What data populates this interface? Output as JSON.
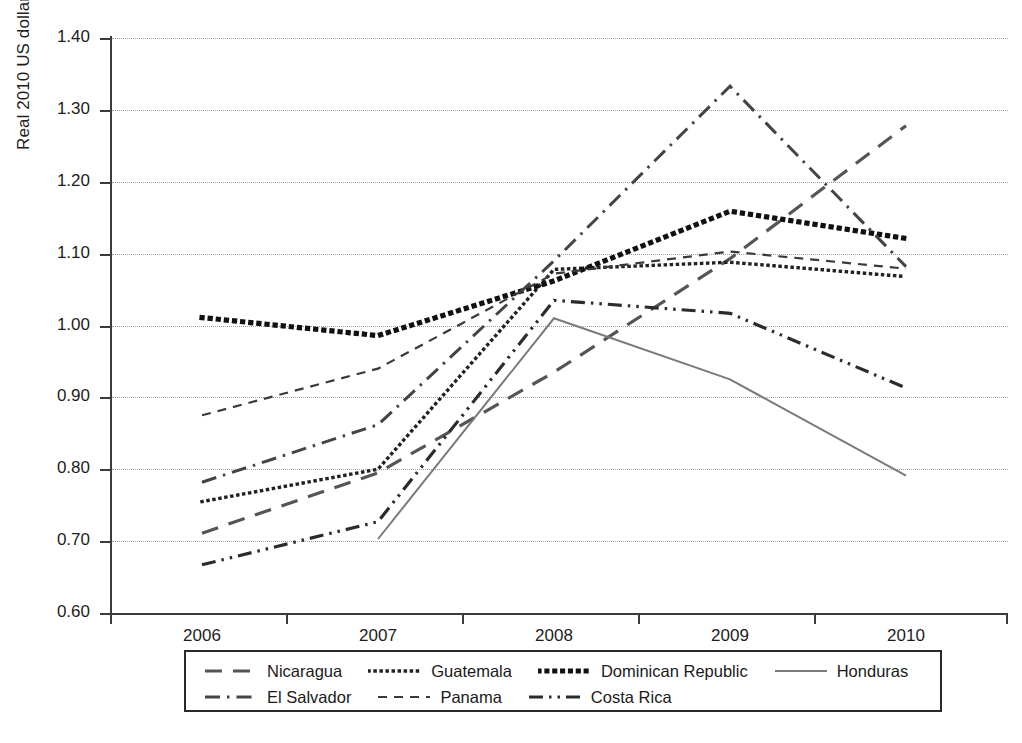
{
  "chart_data": {
    "type": "line",
    "title": "",
    "xlabel": "",
    "ylabel": "Real 2010 US dollars per kilo",
    "x": [
      "2006",
      "2007",
      "2008",
      "2009",
      "2010"
    ],
    "xlim": [
      2005.5,
      2010.5
    ],
    "ylim": [
      0.6,
      1.4
    ],
    "yticks": [
      "0.60",
      "0.70",
      "0.80",
      "0.90",
      "1.00",
      "1.10",
      "1.20",
      "1.30",
      "1.40"
    ],
    "grid": true,
    "legend_position": "bottom",
    "series": [
      {
        "name": "Nicaragua",
        "dash": "long-dash",
        "color": "#555555",
        "width": 3.2,
        "values": [
          0.711,
          0.795,
          0.935,
          1.093,
          1.278
        ]
      },
      {
        "name": "Guatemala",
        "dash": "dotted",
        "color": "#222222",
        "width": 3.4,
        "values": [
          0.755,
          0.8,
          1.078,
          1.088,
          1.068
        ]
      },
      {
        "name": "Dominican Republic",
        "dash": "thick-dotted",
        "color": "#111111",
        "width": 5.2,
        "values": [
          1.011,
          0.986,
          1.062,
          1.159,
          1.121
        ]
      },
      {
        "name": "Honduras",
        "dash": "solid",
        "color": "#7a7a7a",
        "width": 2.0,
        "values": [
          null,
          0.703,
          1.01,
          0.925,
          0.791
        ]
      },
      {
        "name": "El Salvador",
        "dash": "dash-dot",
        "color": "#444444",
        "width": 3.0,
        "values": [
          0.782,
          0.862,
          1.09,
          1.333,
          1.082
        ]
      },
      {
        "name": "Panama",
        "dash": "short-dash",
        "color": "#3a3a3a",
        "width": 2.2,
        "values": [
          0.875,
          0.94,
          1.072,
          1.103,
          1.079
        ]
      },
      {
        "name": "Costa Rica",
        "dash": "dash-dot-dot",
        "color": "#2b2b2b",
        "width": 3.2,
        "values": [
          0.667,
          0.727,
          1.035,
          1.017,
          0.913
        ]
      }
    ]
  },
  "axis": {
    "y_ticks": [
      "1.40",
      "1.30",
      "1.20",
      "1.10",
      "1.00",
      "0.90",
      "0.80",
      "0.70",
      "0.60"
    ],
    "y_title": "Real 2010 US dollars per kilo",
    "x_ticks": [
      "2006",
      "2007",
      "2008",
      "2009",
      "2010"
    ]
  },
  "legend": {
    "row1": [
      {
        "label": "Nicaragua",
        "dash": "long-dash"
      },
      {
        "label": "Guatemala",
        "dash": "dotted"
      },
      {
        "label": "Dominican Republic",
        "dash": "thick-dotted"
      },
      {
        "label": "Honduras",
        "dash": "solid"
      }
    ],
    "row2": [
      {
        "label": "El Salvador",
        "dash": "dash-dot"
      },
      {
        "label": "Panama",
        "dash": "short-dash"
      },
      {
        "label": "Costa Rica",
        "dash": "dash-dot-dot"
      }
    ]
  }
}
